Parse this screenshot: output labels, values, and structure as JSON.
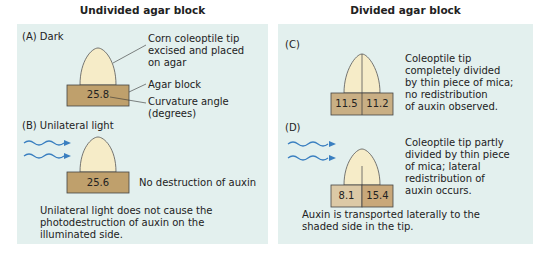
{
  "left": {
    "title": "Undivided agar block",
    "panel_a": {
      "label": "(A) Dark",
      "annotation_tip": [
        "Corn coleoptile tip",
        "excised and placed",
        "on agar"
      ],
      "annotation_block": "Agar block",
      "annotation_angle": [
        "Curvature angle",
        "(degrees)"
      ],
      "value": "25.8"
    },
    "panel_b": {
      "label": "(B) Unilateral light",
      "value": "25.6",
      "note": "No destruction of auxin",
      "conclusion": [
        "Unilateral light does not cause the",
        "photodestruction of auxin on the",
        "illuminated side."
      ]
    }
  },
  "right": {
    "title": "Divided agar block",
    "panel_c": {
      "label": "(C)",
      "left_value": "11.5",
      "right_value": "11.2",
      "description": [
        "Coleoptile tip",
        "completely divided",
        "by thin piece of mica;",
        "no redistribution",
        "of auxin observed."
      ]
    },
    "panel_d": {
      "label": "(D)",
      "left_value": "8.1",
      "right_value": "15.4",
      "description": [
        "Coleoptile tip partly",
        "divided by thin piece",
        "of mica; lateral",
        "redistribution of",
        "auxin occurs."
      ],
      "conclusion": [
        "Auxin is transported laterally to the",
        "shaded side in the tip."
      ]
    }
  },
  "colors": {
    "panel_bg": "#e3f0ee",
    "agar": "#bfa06c",
    "agar_light": "#dcc9a6",
    "agar_mid": "#c9af84",
    "tip": "#f6ecc8",
    "light_wave": "#3a7fc0"
  }
}
